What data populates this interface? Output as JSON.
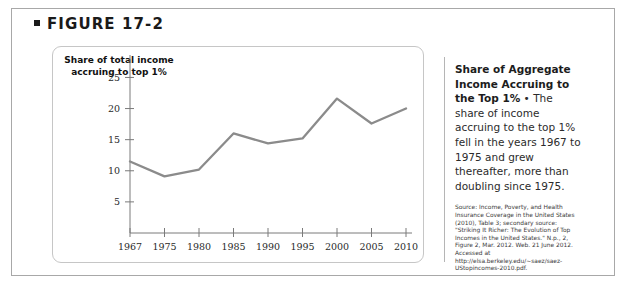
{
  "figure": {
    "label": "FIGURE 17-2",
    "bullet_icon": "square-bullet-icon"
  },
  "caption": {
    "lead": "Share of Aggregate Income Accruing to the Top 1%",
    "separator": " • ",
    "text": "The share of income accruing to the top 1% fell in the years 1967 to 1975 and grew thereafter, more than doubling since 1975.",
    "source": "Source: Income, Poverty, and Health Insurance Coverage in the United States (2010), Table 3; secondary source: \"Striking It Richer: The Evolution of Top Incomes in the United States.\" N.p., 2, Figure 2, Mar. 2012. Web. 21 June 2012. Accessed at http://elsa.berkeley.edu/~saez/saez-UStopincomes-2010.pdf."
  },
  "colors": {
    "header_band": "#cfcfcf",
    "body_band": "#eceaea",
    "card": "#ffffff",
    "line": "#8b8b8b",
    "axis": "#7a7a7a",
    "text": "#1a1a1a"
  },
  "chart_data": {
    "type": "line",
    "title": "",
    "ylabel": "Share of total income accruing to top 1%",
    "xlabel": "",
    "categories": [
      "1967",
      "1975",
      "1980",
      "1985",
      "1990",
      "1995",
      "2000",
      "2005",
      "2010"
    ],
    "values": [
      11.5,
      9.1,
      10.2,
      16.0,
      14.4,
      15.2,
      21.6,
      17.6,
      20.0
    ],
    "yticks": [
      5,
      10,
      15,
      20,
      25
    ],
    "ylim": [
      0,
      27
    ],
    "xlim": [
      0,
      8
    ],
    "grid": false,
    "legend": null,
    "series": [
      {
        "name": "Share of total income accruing to top 1%",
        "values": [
          11.5,
          9.1,
          10.2,
          16.0,
          14.4,
          15.2,
          21.6,
          17.6,
          20.0
        ]
      }
    ]
  }
}
